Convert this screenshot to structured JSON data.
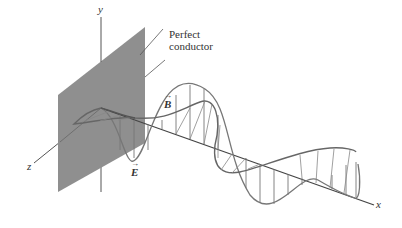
{
  "diagram": {
    "axes": {
      "x": "x",
      "y": "y",
      "z": "z"
    },
    "plate_label_line1": "Perfect",
    "plate_label_line2": "conductor",
    "b_field_label": "B",
    "e_field_label": "E",
    "vector_arrow": "→",
    "colors": {
      "plate": "#8a8a8a",
      "lines": "#5a5a5a",
      "background": "#ffffff"
    }
  }
}
